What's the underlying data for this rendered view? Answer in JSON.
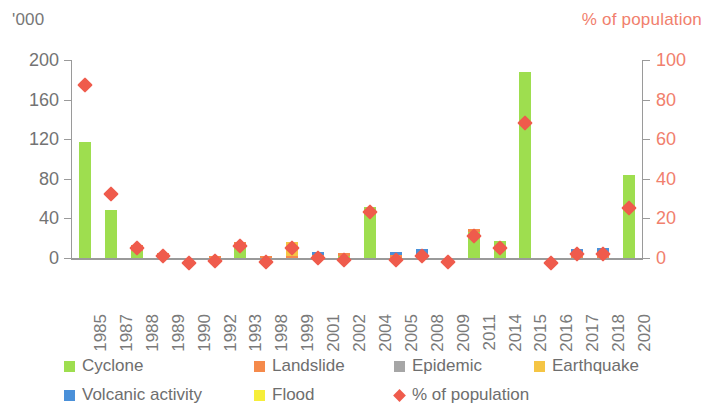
{
  "axes": {
    "left_caption": "'000",
    "right_caption": "% of population",
    "left_ticks": [
      "200",
      "160",
      "120",
      "80",
      "40",
      "0"
    ],
    "right_ticks": [
      "100",
      "80",
      "60",
      "40",
      "20",
      "0"
    ]
  },
  "legend": {
    "rows": [
      [
        {
          "label": "Cyclone",
          "color": "#9ede4f",
          "shape": "square"
        },
        {
          "label": "Landslide",
          "color": "#f58a4b",
          "shape": "square"
        },
        {
          "label": "Epidemic",
          "color": "#a6a6a6",
          "shape": "square"
        },
        {
          "label": "Earthquake",
          "color": "#f5c544",
          "shape": "square"
        }
      ],
      [
        {
          "label": "Volcanic activity",
          "color": "#4a90d9",
          "shape": "square"
        },
        {
          "label": "Flood",
          "color": "#f6ee3a",
          "shape": "square"
        },
        {
          "label": "% of population",
          "color": "#ef5b4c",
          "shape": "diamond"
        }
      ]
    ]
  },
  "chart_data": {
    "type": "bar",
    "title": "",
    "subtitle": "",
    "xlabel": "",
    "ylabel": "'000",
    "y2label": "% of population",
    "ylim": [
      0,
      200
    ],
    "y2lim": [
      0,
      100
    ],
    "grid": false,
    "legend_position": "bottom",
    "stacked": true,
    "categories": [
      "1985",
      "1987",
      "1988",
      "1989",
      "1990",
      "1992",
      "1993",
      "1998",
      "1999",
      "2001",
      "2002",
      "2004",
      "2005",
      "2008",
      "2009",
      "2011",
      "2014",
      "2015",
      "2016",
      "2017",
      "2018",
      "2020"
    ],
    "series": [
      {
        "name": "Cyclone",
        "color": "#9ede4f",
        "axis": "left",
        "values": [
          117,
          48,
          7,
          2,
          0,
          0,
          13,
          0,
          0,
          0,
          2,
          52,
          0,
          0,
          0,
          26,
          17,
          188,
          0,
          0,
          0,
          84
        ]
      },
      {
        "name": "Landslide",
        "color": "#f58a4b",
        "axis": "left",
        "values": [
          0,
          0,
          6,
          3,
          0,
          2,
          3,
          2,
          2,
          3,
          3,
          0,
          3,
          4,
          0,
          3,
          0,
          0,
          0,
          3,
          3,
          0
        ]
      },
      {
        "name": "Epidemic",
        "color": "#a6a6a6",
        "axis": "left",
        "values": [
          0,
          0,
          0,
          0,
          0,
          0,
          0,
          0,
          0,
          0,
          0,
          0,
          0,
          0,
          0,
          0,
          0,
          0,
          0,
          0,
          0,
          0
        ]
      },
      {
        "name": "Earthquake",
        "color": "#f5c544",
        "axis": "left",
        "values": [
          0,
          0,
          0,
          0,
          0,
          0,
          0,
          0,
          14,
          0,
          0,
          0,
          0,
          0,
          0,
          0,
          0,
          0,
          0,
          0,
          0,
          0
        ]
      },
      {
        "name": "Volcanic activity",
        "color": "#4a90d9",
        "axis": "left",
        "values": [
          0,
          0,
          0,
          0,
          0,
          0,
          0,
          0,
          0,
          3,
          0,
          0,
          3,
          5,
          0,
          0,
          0,
          0,
          0,
          6,
          7,
          0
        ]
      },
      {
        "name": "Flood",
        "color": "#f6ee3a",
        "axis": "left",
        "values": [
          0,
          0,
          0,
          0,
          0,
          0,
          0,
          0,
          0,
          0,
          0,
          0,
          0,
          0,
          0,
          0,
          0,
          0,
          0,
          0,
          0,
          0
        ]
      }
    ],
    "marker_series": {
      "name": "% of population",
      "color": "#ef5b4c",
      "axis": "right",
      "marker": "diamond",
      "values": [
        90,
        35,
        8,
        4,
        0.5,
        1.5,
        9,
        1,
        8,
        3,
        2,
        26,
        2,
        4,
        1,
        14,
        8,
        71,
        0.5,
        5,
        5,
        28
      ]
    }
  }
}
